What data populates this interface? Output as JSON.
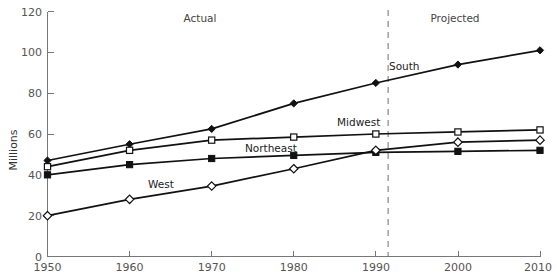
{
  "chart_data": {
    "type": "line",
    "title": "",
    "xlabel": "",
    "ylabel": "Millions",
    "x": [
      1950,
      1960,
      1970,
      1980,
      1990,
      2000,
      2010
    ],
    "xticklabels": [
      "1950",
      "1960",
      "1970",
      "1980",
      "1990",
      "2000",
      "2010"
    ],
    "yticklabels": [
      "0",
      "20",
      "40",
      "60",
      "80",
      "100",
      "120"
    ],
    "yticks": [
      0,
      20,
      40,
      60,
      80,
      100,
      120
    ],
    "xlim": [
      1950,
      2010
    ],
    "ylim": [
      0,
      120
    ],
    "grid": false,
    "legend_position": "inline-labels",
    "series": [
      {
        "name": "South",
        "marker": "filled-diamond",
        "color": "#111111",
        "values": [
          47,
          55,
          62.5,
          75,
          85,
          94,
          101
        ]
      },
      {
        "name": "Midwest",
        "marker": "open-square",
        "color": "#111111",
        "values": [
          44,
          52,
          57,
          58.5,
          60,
          61,
          62
        ]
      },
      {
        "name": "Northeast",
        "marker": "filled-square",
        "color": "#111111",
        "values": [
          40,
          45,
          48,
          49.5,
          51,
          51.5,
          52
        ]
      },
      {
        "name": "West",
        "marker": "open-diamond",
        "color": "#111111",
        "values": [
          20,
          28,
          34.5,
          43,
          52,
          56,
          57
        ]
      }
    ],
    "annotations": [
      {
        "text": "Actual",
        "x": 1968,
        "y": 116,
        "role": "period-label"
      },
      {
        "text": "Projected",
        "x": 1999,
        "y": 116,
        "role": "period-label"
      },
      {
        "text": "South",
        "x": 1992,
        "y": 88,
        "role": "series-label"
      },
      {
        "text": "Midwest",
        "x": 1986,
        "y": 66,
        "role": "series-label"
      },
      {
        "text": "Northeast",
        "x": 1975,
        "y": 54,
        "role": "series-label"
      },
      {
        "text": "West",
        "x": 1964,
        "y": 38,
        "role": "series-label"
      }
    ],
    "divider": {
      "x": 1991.5,
      "style": "dashed",
      "color": "#999999",
      "label_left": "Actual",
      "label_right": "Projected"
    }
  },
  "axis": {
    "y_title": "Millions"
  }
}
